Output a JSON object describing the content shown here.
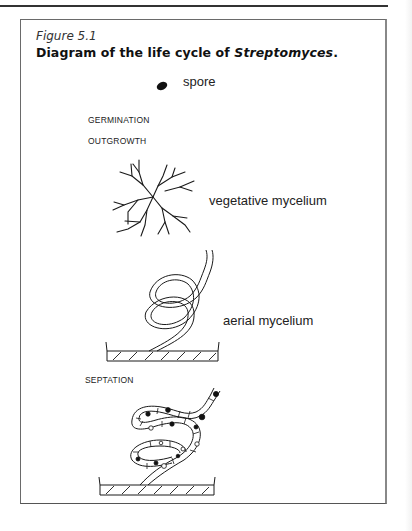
{
  "figure": {
    "label": "Figure 5.1",
    "title_prefix": "Diagram of the life cycle of ",
    "title_organism": "Streptomyces",
    "title_suffix": "."
  },
  "diagram": {
    "stages": [
      {
        "id": "spore",
        "label": "spore",
        "kind": "structure"
      },
      {
        "id": "germination",
        "label": "GERMINATION",
        "kind": "process"
      },
      {
        "id": "outgrowth",
        "label": "OUTGROWTH",
        "kind": "process"
      },
      {
        "id": "vegetative",
        "label": "vegetative mycelium",
        "kind": "structure"
      },
      {
        "id": "aerial",
        "label": "aerial mycelium",
        "kind": "structure"
      },
      {
        "id": "septation",
        "label": "SEPTATION",
        "kind": "process"
      }
    ],
    "colors": {
      "ink": "#1a1a1a",
      "border": "#6a6a6a",
      "background": "#ffffff"
    }
  }
}
